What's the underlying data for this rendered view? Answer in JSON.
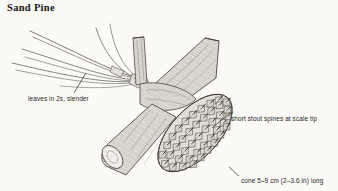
{
  "plate": {
    "title": "Sand Pine",
    "background_color": "#fbfaf6",
    "ink_color": "#3d3a36"
  },
  "annotations": {
    "leaves": "leaves in 2s, slender",
    "spines": "short stout spines at scale tip",
    "cone": "cone 5–9 cm (2–3.6 in) long"
  },
  "figure": {
    "parts": [
      "needle-fascicle",
      "branch",
      "cut-branch-stub",
      "vertical-twig",
      "seed-cone"
    ]
  }
}
